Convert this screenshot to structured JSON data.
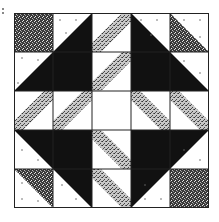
{
  "figure": {
    "grid": {
      "rows": 5,
      "cols": 5
    },
    "colors": {
      "black": "#111111",
      "white": "#ffffff",
      "dark_stipple": "#555555",
      "light_stipple": "#9a9a9a",
      "outline": "#222222"
    },
    "corner_squares": [
      {
        "row": 0,
        "col": 0,
        "fill": "dark_stipple"
      },
      {
        "row": 4,
        "col": 4,
        "fill": "dark_stipple"
      }
    ],
    "large_triangles": [
      {
        "block": "top-left",
        "fill": "black",
        "position": "lower-right half"
      },
      {
        "block": "top-right",
        "fill": "black",
        "position": "lower-left half"
      },
      {
        "block": "bottom-left",
        "fill": "black",
        "position": "upper-right half"
      },
      {
        "block": "bottom-right",
        "fill": "black",
        "position": "upper-left half"
      }
    ],
    "half_square_triangles": [
      {
        "row": 0,
        "col": 4,
        "fill": "light_stipple",
        "position": "lower-left"
      },
      {
        "row": 4,
        "col": 0,
        "fill": "light_stipple",
        "position": "upper-right"
      }
    ],
    "band_cells": [
      {
        "row": 0,
        "col": 2,
        "direction": "/"
      },
      {
        "row": 1,
        "col": 2,
        "direction": "/"
      },
      {
        "row": 3,
        "col": 2,
        "direction": "\\"
      },
      {
        "row": 4,
        "col": 2,
        "direction": "\\"
      },
      {
        "row": 2,
        "col": 0,
        "direction": "/"
      },
      {
        "row": 2,
        "col": 1,
        "direction": "/"
      },
      {
        "row": 2,
        "col": 3,
        "direction": "\\"
      },
      {
        "row": 2,
        "col": 4,
        "direction": "\\"
      }
    ],
    "center": {
      "row": 2,
      "col": 2,
      "fill": "white"
    }
  }
}
